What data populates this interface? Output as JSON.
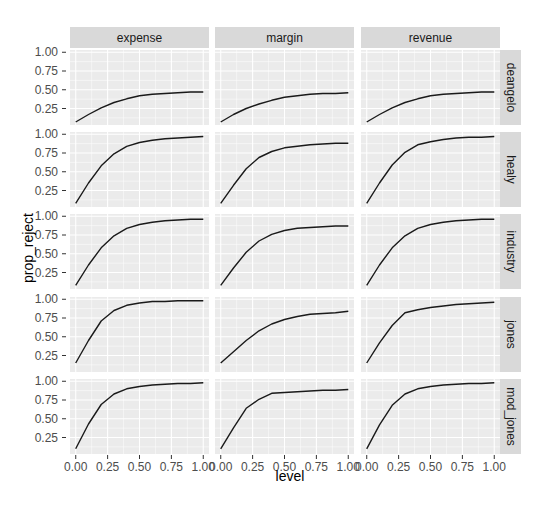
{
  "chart_data": {
    "type": "line",
    "title": "",
    "xlabel": "level",
    "ylabel": "prop_reject",
    "facet_cols": [
      "expense",
      "margin",
      "revenue"
    ],
    "facet_rows": [
      "deangelo",
      "healy",
      "industry",
      "jones",
      "mod_jones"
    ],
    "x": [
      0.0,
      0.1,
      0.2,
      0.3,
      0.4,
      0.5,
      0.6,
      0.7,
      0.8,
      0.9,
      1.0
    ],
    "x_ticks": [
      "0.00",
      "0.25",
      "0.50",
      "0.75",
      "1.00"
    ],
    "y_ticks": [
      "0.25",
      "0.50",
      "0.75",
      "1.00"
    ],
    "xlim": [
      0,
      1
    ],
    "ylim": [
      0.05,
      1.0
    ],
    "grid": true,
    "legend": "none",
    "panels": {
      "deangelo": {
        "expense": [
          0.07,
          0.17,
          0.26,
          0.33,
          0.38,
          0.42,
          0.44,
          0.45,
          0.46,
          0.47,
          0.47
        ],
        "margin": [
          0.07,
          0.17,
          0.25,
          0.31,
          0.36,
          0.4,
          0.42,
          0.44,
          0.45,
          0.45,
          0.46
        ],
        "revenue": [
          0.07,
          0.17,
          0.26,
          0.33,
          0.38,
          0.42,
          0.44,
          0.45,
          0.46,
          0.47,
          0.47
        ]
      },
      "healy": {
        "expense": [
          0.08,
          0.35,
          0.58,
          0.74,
          0.84,
          0.89,
          0.92,
          0.94,
          0.95,
          0.96,
          0.97
        ],
        "margin": [
          0.08,
          0.32,
          0.54,
          0.69,
          0.77,
          0.82,
          0.84,
          0.86,
          0.87,
          0.88,
          0.88
        ],
        "revenue": [
          0.08,
          0.35,
          0.59,
          0.76,
          0.86,
          0.9,
          0.93,
          0.95,
          0.96,
          0.96,
          0.97
        ]
      },
      "industry": {
        "expense": [
          0.08,
          0.35,
          0.58,
          0.74,
          0.84,
          0.89,
          0.92,
          0.94,
          0.95,
          0.96,
          0.96
        ],
        "margin": [
          0.08,
          0.31,
          0.52,
          0.67,
          0.76,
          0.81,
          0.84,
          0.85,
          0.86,
          0.87,
          0.87
        ],
        "revenue": [
          0.08,
          0.35,
          0.58,
          0.74,
          0.84,
          0.89,
          0.92,
          0.94,
          0.95,
          0.96,
          0.96
        ]
      },
      "jones": {
        "expense": [
          0.15,
          0.45,
          0.71,
          0.85,
          0.92,
          0.95,
          0.97,
          0.97,
          0.98,
          0.98,
          0.98
        ],
        "margin": [
          0.15,
          0.3,
          0.45,
          0.58,
          0.67,
          0.73,
          0.77,
          0.8,
          0.81,
          0.82,
          0.84
        ],
        "revenue": [
          0.15,
          0.42,
          0.65,
          0.82,
          0.86,
          0.89,
          0.91,
          0.93,
          0.94,
          0.95,
          0.96
        ]
      },
      "mod_jones": {
        "expense": [
          0.1,
          0.43,
          0.69,
          0.83,
          0.9,
          0.93,
          0.95,
          0.96,
          0.97,
          0.97,
          0.98
        ],
        "margin": [
          0.1,
          0.38,
          0.64,
          0.76,
          0.84,
          0.85,
          0.86,
          0.87,
          0.88,
          0.88,
          0.89
        ],
        "revenue": [
          0.1,
          0.42,
          0.68,
          0.83,
          0.9,
          0.93,
          0.95,
          0.96,
          0.97,
          0.97,
          0.98
        ]
      }
    }
  },
  "colors": {
    "panel_bg": "#EBEBEB",
    "strip_bg": "#D9D9D9",
    "grid": "#FFFFFF",
    "line": "#1A1A1A",
    "tick_text": "#4D4D4D",
    "strip_text": "#1A1A1A"
  }
}
